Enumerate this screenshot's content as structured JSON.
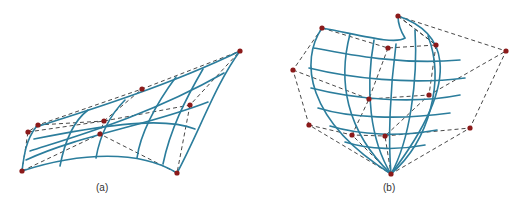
{
  "figure": {
    "panels": [
      {
        "id": "a",
        "label": "(a)",
        "description": "Bezier surface patch with control net"
      },
      {
        "id": "b",
        "label": "(b)",
        "description": "Bezier surface patch with control net"
      }
    ],
    "colors": {
      "surface": "#2b7d9c",
      "control_point": "#8b1a1a",
      "control_net": "#333333"
    }
  }
}
